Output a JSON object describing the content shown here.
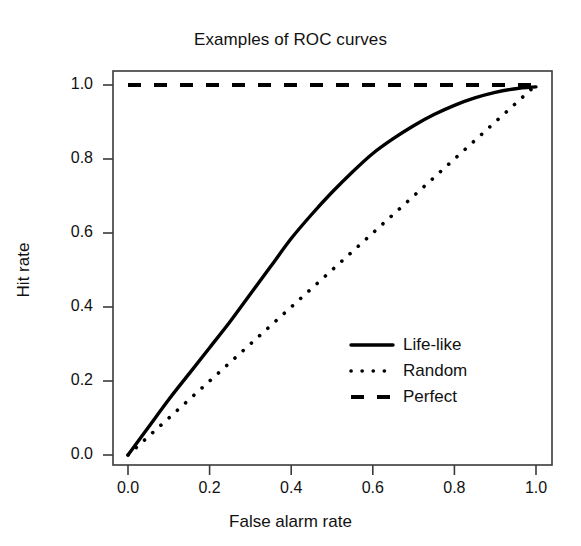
{
  "chart_data": {
    "type": "line",
    "title": "Examples of ROC curves",
    "xlabel": "False alarm rate",
    "ylabel": "Hit rate",
    "xlim": [
      0,
      1
    ],
    "ylim": [
      0,
      1
    ],
    "grid": false,
    "legend_position": "bottom-right",
    "xticks": [
      "0.0",
      "0.2",
      "0.4",
      "0.6",
      "0.8",
      "1.0"
    ],
    "yticks": [
      "0.0",
      "0.2",
      "0.4",
      "0.6",
      "0.8",
      "1.0"
    ],
    "xtick_values": [
      0.0,
      0.2,
      0.4,
      0.6,
      0.8,
      1.0
    ],
    "ytick_values": [
      0.0,
      0.2,
      0.4,
      0.6,
      0.8,
      1.0
    ],
    "line_color": "#000000",
    "series": [
      {
        "name": "Life-like",
        "style": "solid",
        "x": [
          0.0,
          0.05,
          0.1,
          0.15,
          0.2,
          0.25,
          0.3,
          0.35,
          0.4,
          0.45,
          0.5,
          0.55,
          0.6,
          0.65,
          0.7,
          0.75,
          0.8,
          0.85,
          0.9,
          0.95,
          1.0
        ],
        "values": [
          0.0,
          0.075,
          0.15,
          0.22,
          0.29,
          0.36,
          0.435,
          0.51,
          0.585,
          0.65,
          0.71,
          0.765,
          0.815,
          0.855,
          0.89,
          0.92,
          0.945,
          0.965,
          0.98,
          0.99,
          0.995
        ]
      },
      {
        "name": "Random",
        "style": "dotted",
        "x": [
          0.0,
          1.0
        ],
        "values": [
          0.0,
          1.0
        ]
      },
      {
        "name": "Perfect",
        "style": "dashed",
        "x": [
          0.0,
          1.0
        ],
        "values": [
          1.0,
          1.0
        ]
      }
    ]
  },
  "legend": {
    "items": [
      {
        "label": "Life-like",
        "style": "solid"
      },
      {
        "label": "Random",
        "style": "dotted"
      },
      {
        "label": "Perfect",
        "style": "dashed"
      }
    ]
  }
}
